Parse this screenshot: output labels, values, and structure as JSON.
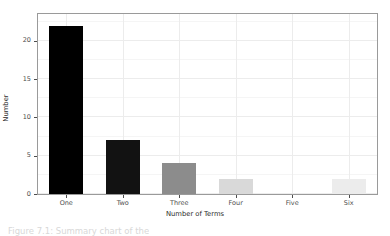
{
  "chart_data": {
    "type": "bar",
    "title": "",
    "xlabel": "Number of Terms",
    "ylabel": "Number",
    "categories": [
      "One",
      "Two",
      "Three",
      "Four",
      "Five",
      "Six"
    ],
    "values": [
      22,
      7,
      4,
      2,
      0,
      2
    ],
    "bar_colors": [
      "#000000",
      "#121212",
      "#8c8c8c",
      "#d9d9d9",
      "#ffffff",
      "#ececec"
    ],
    "ylim": [
      0,
      23.5
    ],
    "yticks": [
      0,
      5,
      10,
      15,
      20
    ],
    "ytick_labels": [
      "0",
      "5",
      "10",
      "15",
      "20"
    ],
    "grid": true,
    "legend": "none",
    "panel_background": "#ffffff",
    "panel_border_color": "#9a9a9a",
    "gridline_color": "#ececec"
  },
  "figure": {
    "caption": "Figure 7.1: Summary chart of the"
  }
}
